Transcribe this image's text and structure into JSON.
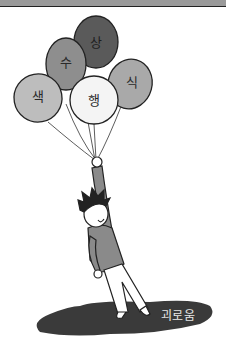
{
  "illustration": {
    "description": "Cartoon man hanging from a bunch of balloons above a dark shadow",
    "balloons": [
      {
        "label": "상",
        "fill": "#5a5a5a",
        "x": 96,
        "y": 42
      },
      {
        "label": "수",
        "fill": "#8e8e8e",
        "x": 66,
        "y": 62
      },
      {
        "label": "색",
        "fill": "#bdbdbd",
        "x": 38,
        "y": 96
      },
      {
        "label": "행",
        "fill": "#f4f4f4",
        "x": 94,
        "y": 100
      },
      {
        "label": "식",
        "fill": "#a9a9a9",
        "x": 132,
        "y": 82
      }
    ],
    "shadow": {
      "label": "괴로움",
      "fill": "#3a3a3a"
    },
    "colors": {
      "top_band": "#9a9a9a",
      "outline": "#222222",
      "sweater": "#8a8a8a",
      "pants": "#ffffff"
    }
  }
}
